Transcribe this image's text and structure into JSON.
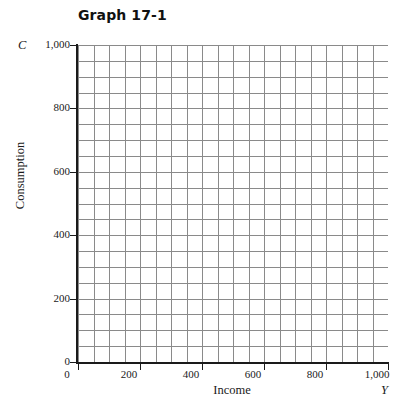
{
  "chart_data": {
    "type": "grid",
    "title": "Graph 17-1",
    "xlabel": "Income",
    "ylabel": "Consumption",
    "x_symbol": "Y",
    "y_symbol": "C",
    "xlim": [
      0,
      1000
    ],
    "ylim": [
      0,
      1000
    ],
    "x_ticks": [
      {
        "value": 0,
        "label": "0"
      },
      {
        "value": 200,
        "label": "200"
      },
      {
        "value": 400,
        "label": "400"
      },
      {
        "value": 600,
        "label": "600"
      },
      {
        "value": 800,
        "label": "800"
      },
      {
        "value": 1000,
        "label": "1,000"
      }
    ],
    "y_ticks": [
      {
        "value": 0,
        "label": "0"
      },
      {
        "value": 200,
        "label": "200"
      },
      {
        "value": 400,
        "label": "400"
      },
      {
        "value": 600,
        "label": "600"
      },
      {
        "value": 800,
        "label": "800"
      },
      {
        "value": 1000,
        "label": "1,000"
      }
    ],
    "grid": true,
    "grid_columns": 20,
    "grid_rows": 20,
    "grid_cell_value": 50,
    "grid_color": "#8a8a8a",
    "axis_color": "#1a1a1a",
    "background_color": "#ffffff",
    "series": []
  }
}
